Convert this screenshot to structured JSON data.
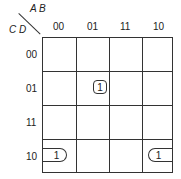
{
  "kmap": {
    "row_var": "C D",
    "col_var": "A B",
    "columns": [
      "00",
      "01",
      "11",
      "10"
    ],
    "rows": [
      "00",
      "01",
      "11",
      "10"
    ],
    "cells": [
      [
        "",
        "",
        "",
        ""
      ],
      [
        "",
        "1",
        "",
        ""
      ],
      [
        "",
        "",
        "",
        ""
      ],
      [
        "1",
        "",
        "",
        "1"
      ]
    ],
    "groups": [
      {
        "cells": [
          [
            1,
            1
          ]
        ],
        "label": "1"
      },
      {
        "cells": [
          [
            3,
            0
          ],
          [
            3,
            3
          ]
        ],
        "label": "1",
        "wraparound": true
      }
    ]
  }
}
